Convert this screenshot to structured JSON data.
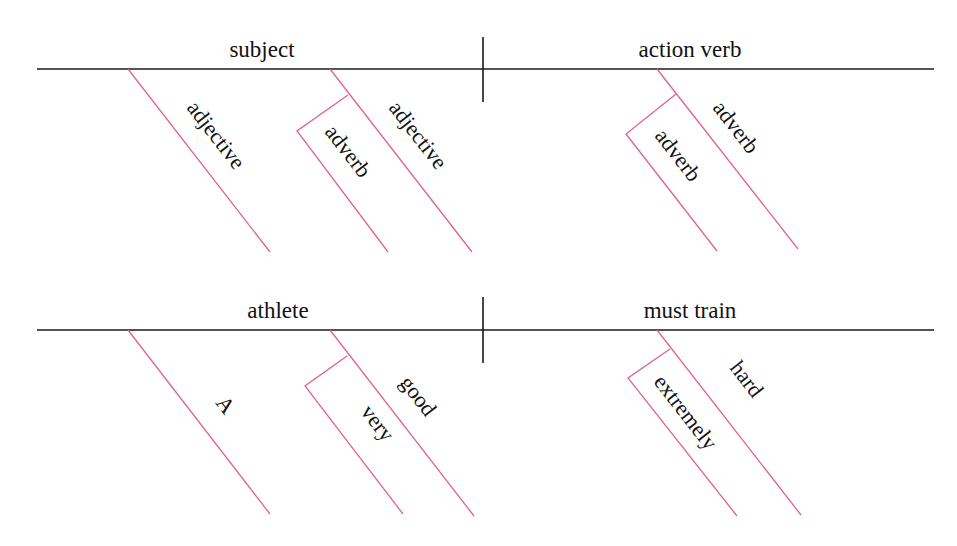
{
  "colors": {
    "baseline": "#1a1a1a",
    "modifier": "#e0648a",
    "text": "#111111"
  },
  "template_diagram": {
    "subject": "subject",
    "verb": "action verb",
    "subject_modifiers": [
      {
        "label": "adjective"
      },
      {
        "label": "adjective",
        "sub_modifier": "adverb"
      }
    ],
    "verb_modifiers": [
      {
        "label": "adverb",
        "sub_modifier": "adverb"
      }
    ]
  },
  "example_diagram": {
    "subject": "athlete",
    "verb": "must train",
    "subject_modifiers": [
      {
        "label": "A"
      },
      {
        "label": "good",
        "sub_modifier": "very"
      }
    ],
    "verb_modifiers": [
      {
        "label": "hard",
        "sub_modifier": "extremely"
      }
    ]
  }
}
